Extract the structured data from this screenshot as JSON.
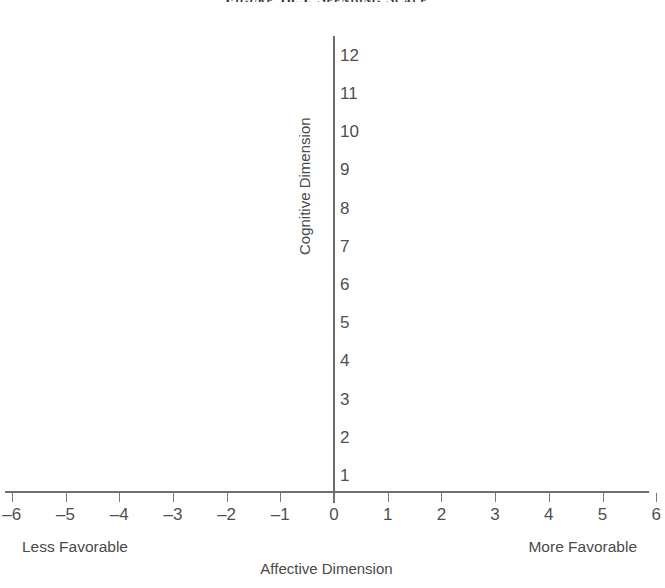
{
  "figure": {
    "title": "Figure 10.5. Spending Scale"
  },
  "labels": {
    "y_axis_title": "Cognitive Dimension",
    "x_axis_title": "Affective Dimension",
    "left_anchor": "Less Favorable",
    "right_anchor": "More Favorable"
  },
  "colors": {
    "axis_line": "#6b6b6b",
    "tick_mark": "#7a7a7a",
    "tick_text": "#4f4f4f",
    "label_text": "#4a4a4a",
    "title_text": "#3b3b3b",
    "background": "#ffffff"
  },
  "chart_data": {
    "type": "scatter",
    "title": "Figure 10.5. Spending Scale",
    "xlabel": "Affective Dimension",
    "ylabel": "Cognitive Dimension",
    "xlim": [
      -6.6,
      6.6
    ],
    "ylim": [
      0,
      12.6
    ],
    "grid": false,
    "legend": null,
    "series": [],
    "x": [],
    "y": [],
    "x_ticks": [
      -6,
      -5,
      -4,
      -3,
      -2,
      -1,
      0,
      1,
      2,
      3,
      4,
      5,
      6
    ],
    "x_tick_labels": [
      "–6",
      "–5",
      "–4",
      "–3",
      "–2",
      "–1",
      "0",
      "1",
      "2",
      "3",
      "4",
      "5",
      "6"
    ],
    "y_ticks": [
      1,
      2,
      3,
      4,
      5,
      6,
      7,
      8,
      9,
      10,
      11,
      12
    ],
    "y_tick_labels": [
      "1",
      "2",
      "3",
      "4",
      "5",
      "6",
      "7",
      "8",
      "9",
      "10",
      "11",
      "12"
    ],
    "annotations": [
      {
        "text": "Less Favorable",
        "position": "bottom-left"
      },
      {
        "text": "More Favorable",
        "position": "bottom-right"
      }
    ]
  }
}
